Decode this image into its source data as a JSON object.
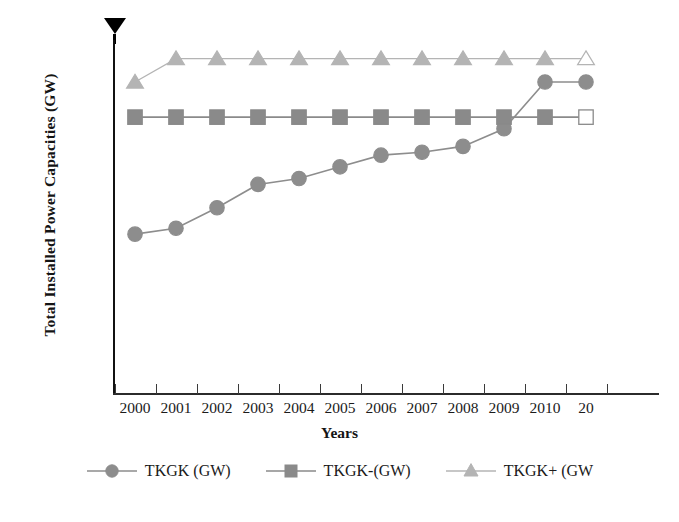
{
  "chart_data": {
    "type": "line",
    "title": "",
    "subtitle": "",
    "xlabel": "Years",
    "ylabel": "Total Installed Power Capacities (GW)",
    "categories": [
      "2000",
      "2001",
      "2002",
      "2003",
      "2004",
      "2005",
      "2006",
      "2007",
      "2008",
      "2009",
      "2010",
      "20"
    ],
    "x_tick_labels": [
      "2000",
      "2001",
      "2002",
      "2003",
      "2004",
      "2005",
      "2006",
      "2007",
      "2008",
      "2009",
      "2010",
      "20"
    ],
    "y_tick_labels": [
      "000",
      "010",
      "020",
      "030",
      "040",
      "050",
      "060"
    ],
    "y_tick_values": [
      0,
      10,
      20,
      30,
      40,
      50,
      60
    ],
    "ylim": [
      0,
      60
    ],
    "grid": false,
    "legend_position": "bottom",
    "series": [
      {
        "name": "TKGK (GW)",
        "marker": "circle",
        "color": "#8d8d8d",
        "values": [
          27.5,
          28.5,
          32.0,
          36.0,
          37.0,
          39.0,
          41.0,
          41.5,
          42.5,
          45.5,
          53.5,
          53.5
        ],
        "open_last_marker": false
      },
      {
        "name": "TKGK-(GW)",
        "marker": "square",
        "color": "#8a8a8a",
        "values": [
          47.5,
          47.5,
          47.5,
          47.5,
          47.5,
          47.5,
          47.5,
          47.5,
          47.5,
          47.5,
          47.5,
          47.5
        ],
        "open_last_marker": true
      },
      {
        "name": "TKGK+ (GW",
        "marker": "triangle",
        "color": "#b4b4b4",
        "values": [
          53.5,
          57.5,
          57.5,
          57.5,
          57.5,
          57.5,
          57.5,
          57.5,
          57.5,
          57.5,
          57.5,
          57.5
        ],
        "open_last_marker": true
      }
    ]
  },
  "annotations": {
    "cursor_icon": "black-down-triangle-pointer"
  },
  "colors": {
    "axis": "#111111",
    "text": "#1b1b1b",
    "series_circle": "#8d8d8d",
    "series_square": "#8a8a8a",
    "series_triangle": "#b4b4b4"
  }
}
